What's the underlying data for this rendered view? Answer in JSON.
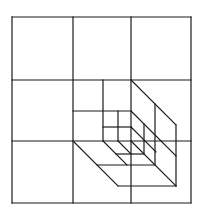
{
  "diagram": {
    "stroke_color": "#1a1a1a",
    "background": "#ffffff",
    "outer_frame": {
      "x1": 12,
      "y1": 17,
      "x2": 191,
      "y2": 203
    },
    "grid_lines": [
      {
        "x1": 73,
        "y1": 17,
        "x2": 73,
        "y2": 203
      },
      {
        "x1": 131,
        "y1": 17,
        "x2": 131,
        "y2": 203
      },
      {
        "x1": 12,
        "y1": 80,
        "x2": 191,
        "y2": 80
      },
      {
        "x1": 12,
        "y1": 141,
        "x2": 191,
        "y2": 141
      }
    ],
    "inner_subdivisions": [
      {
        "x1": 103,
        "y1": 80,
        "x2": 103,
        "y2": 141
      },
      {
        "x1": 73,
        "y1": 111,
        "x2": 131,
        "y2": 111
      },
      {
        "x1": 118,
        "y1": 111,
        "x2": 118,
        "y2": 141
      },
      {
        "x1": 103,
        "y1": 127,
        "x2": 131,
        "y2": 127
      }
    ],
    "depth_edges": [
      {
        "x1": 131,
        "y1": 80,
        "x2": 176,
        "y2": 125
      },
      {
        "x1": 73,
        "y1": 141,
        "x2": 118,
        "y2": 186
      },
      {
        "x1": 131,
        "y1": 141,
        "x2": 176,
        "y2": 186
      },
      {
        "x1": 131,
        "y1": 111,
        "x2": 176,
        "y2": 156
      },
      {
        "x1": 103,
        "y1": 141,
        "x2": 127,
        "y2": 165
      },
      {
        "x1": 131,
        "y1": 127,
        "x2": 156,
        "y2": 152
      },
      {
        "x1": 118,
        "y1": 141,
        "x2": 131,
        "y2": 154
      }
    ],
    "back_faces": [
      {
        "x1": 176,
        "y1": 125,
        "x2": 176,
        "y2": 186
      },
      {
        "x1": 118,
        "y1": 186,
        "x2": 176,
        "y2": 186
      },
      {
        "x1": 155,
        "y1": 104,
        "x2": 155,
        "y2": 165
      },
      {
        "x1": 97,
        "y1": 165,
        "x2": 155,
        "y2": 165
      },
      {
        "x1": 144,
        "y1": 124,
        "x2": 144,
        "y2": 154
      },
      {
        "x1": 116,
        "y1": 154,
        "x2": 144,
        "y2": 154
      }
    ]
  }
}
